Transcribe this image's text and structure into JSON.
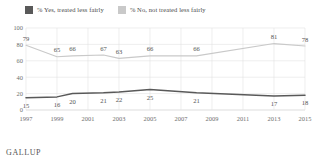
{
  "legend": {
    "items": [
      {
        "label": "% Yes, treated less fairly",
        "color": "#595959",
        "icon": "square-swatch-dark"
      },
      {
        "label": "% No, not treated less fairly",
        "color": "#c9c9c9",
        "icon": "square-swatch-light"
      }
    ]
  },
  "footer": {
    "brand": "GALLUP"
  },
  "chart_data": {
    "type": "line",
    "title": "",
    "subtitle": "",
    "xlabel": "",
    "ylabel": "",
    "grid": true,
    "legend_position": "top-left",
    "x": [
      1997,
      1999,
      2001,
      2003,
      2005,
      2007,
      2009,
      2011,
      2013,
      2015
    ],
    "xlim": [
      1997,
      2015
    ],
    "xtick_labels": [
      "1997",
      "1999",
      "2001",
      "2003",
      "2005",
      "2007",
      "2009",
      "2011",
      "2013",
      "2015"
    ],
    "ylim": [
      0,
      100
    ],
    "ytick_labels": [
      "0",
      "20",
      "40",
      "60",
      "80",
      "100"
    ],
    "yticks": [
      0,
      20,
      40,
      60,
      80,
      100
    ],
    "series": [
      {
        "name": "% No, not treated less fairly",
        "color": "#c9c9c9",
        "points": [
          {
            "x": 1997,
            "y": 79,
            "label": "79"
          },
          {
            "x": 1999,
            "y": 65,
            "label": "65"
          },
          {
            "x": 2000,
            "y": 66,
            "label": "66"
          },
          {
            "x": 2002,
            "y": 67,
            "label": "67"
          },
          {
            "x": 2003,
            "y": 63,
            "label": "63"
          },
          {
            "x": 2005,
            "y": 66,
            "label": "66"
          },
          {
            "x": 2008,
            "y": 66,
            "label": "66"
          },
          {
            "x": 2013,
            "y": 81,
            "label": "81"
          },
          {
            "x": 2015,
            "y": 78,
            "label": "78"
          }
        ]
      },
      {
        "name": "% Yes, treated less fairly",
        "color": "#595959",
        "points": [
          {
            "x": 1997,
            "y": 15,
            "label": "15"
          },
          {
            "x": 1999,
            "y": 16,
            "label": "16"
          },
          {
            "x": 2000,
            "y": 20,
            "label": "20"
          },
          {
            "x": 2002,
            "y": 21,
            "label": "21"
          },
          {
            "x": 2003,
            "y": 22,
            "label": "22"
          },
          {
            "x": 2005,
            "y": 25,
            "label": "25"
          },
          {
            "x": 2008,
            "y": 21,
            "label": "21"
          },
          {
            "x": 2013,
            "y": 17,
            "label": "17"
          },
          {
            "x": 2015,
            "y": 18,
            "label": "18"
          }
        ]
      }
    ]
  }
}
